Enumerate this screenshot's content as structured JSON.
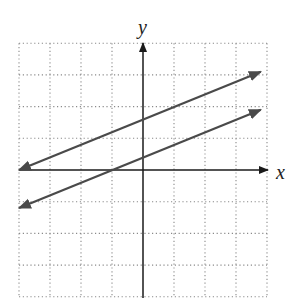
{
  "chart_data": {
    "type": "line",
    "title": "",
    "xlabel": "x",
    "ylabel": "y",
    "xlim": [
      -4,
      4
    ],
    "ylim": [
      -4,
      4
    ],
    "grid": true,
    "grid_style": "dotted",
    "series": [
      {
        "name": "line-upper",
        "equation": "y = 0.4x + 1.6",
        "points": [
          [
            -4,
            0
          ],
          [
            0,
            1.6
          ],
          [
            3.8,
            3.1
          ]
        ],
        "arrows": "both"
      },
      {
        "name": "line-lower",
        "equation": "y = 0.4x + 0.4",
        "points": [
          [
            -4,
            -1.2
          ],
          [
            -1,
            0
          ],
          [
            0,
            0.4
          ],
          [
            3.8,
            1.9
          ]
        ],
        "arrows": "both"
      }
    ]
  },
  "labels": {
    "x_axis": "x",
    "y_axis": "y"
  },
  "colors": {
    "axis": "#1a1a1a",
    "line": "#4a4a4a",
    "grid": "#8a8a8a"
  }
}
